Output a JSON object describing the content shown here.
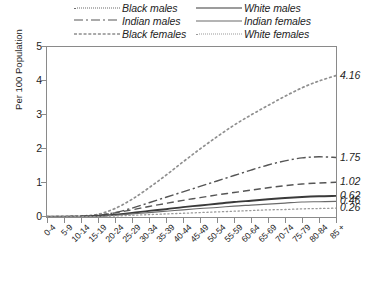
{
  "legend": {
    "entries": [
      {
        "label": "Black males",
        "style": "dotted-coarse",
        "column": "left",
        "row": 0
      },
      {
        "label": "Indian males",
        "style": "dash-dot",
        "column": "left",
        "row": 1
      },
      {
        "label": "Black females",
        "style": "dashed",
        "column": "left",
        "row": 2
      },
      {
        "label": "White males",
        "style": "solid-thick",
        "column": "right",
        "row": 0
      },
      {
        "label": "Indian females",
        "style": "solid-thin",
        "column": "right",
        "row": 1
      },
      {
        "label": "White females",
        "style": "dotted-fine",
        "column": "right",
        "row": 2
      }
    ]
  },
  "axes": {
    "ylabel": "Per 100 Population",
    "yticks": [
      "0",
      "1",
      "2",
      "3",
      "4",
      "5"
    ],
    "xticklabels": [
      "0-4",
      "5-9",
      "10-14",
      "15-19",
      "20-24",
      "25-29",
      "30-34",
      "35-39",
      "40-44",
      "45-49",
      "50-54",
      "55-59",
      "60-64",
      "65-69",
      "70-74",
      "75-79",
      "80-84",
      "85 +"
    ]
  },
  "endpoint_labels": [
    "4.16",
    "1.75",
    "1.02",
    "0.62",
    "0.46",
    "0.26"
  ],
  "colors": {
    "frame": "#8a8a8a",
    "black_males": "#8f8f8f",
    "indian_males": "#555555",
    "black_females": "#555555",
    "white_males": "#3a3a3a",
    "indian_females": "#6a6a6a",
    "white_females": "#9a9a9a",
    "text": "#1d1d1d"
  },
  "chart_data": {
    "type": "line",
    "title": "",
    "xlabel": "",
    "ylabel": "Per 100 Population",
    "ylim": [
      0,
      5
    ],
    "grid": false,
    "legend_position": "above-plot",
    "categories": [
      "0-4",
      "5-9",
      "10-14",
      "15-19",
      "20-24",
      "25-29",
      "30-34",
      "35-39",
      "40-44",
      "45-49",
      "50-54",
      "55-59",
      "60-64",
      "65-69",
      "70-74",
      "75-79",
      "80-84",
      "85 +"
    ],
    "series": [
      {
        "name": "Black males",
        "style": "dotted-coarse",
        "endpoint_label": "4.16",
        "values": [
          0.01,
          0.02,
          0.03,
          0.08,
          0.25,
          0.52,
          0.86,
          1.23,
          1.62,
          2.0,
          2.36,
          2.7,
          3.0,
          3.28,
          3.55,
          3.8,
          4.0,
          4.16
        ]
      },
      {
        "name": "Indian males",
        "style": "dash-dot",
        "endpoint_label": "1.75",
        "values": [
          0.01,
          0.01,
          0.02,
          0.05,
          0.13,
          0.26,
          0.42,
          0.58,
          0.74,
          0.9,
          1.06,
          1.22,
          1.38,
          1.53,
          1.65,
          1.74,
          1.77,
          1.75
        ]
      },
      {
        "name": "Black females",
        "style": "dashed",
        "endpoint_label": "1.02",
        "values": [
          0.01,
          0.01,
          0.02,
          0.05,
          0.12,
          0.21,
          0.31,
          0.4,
          0.49,
          0.57,
          0.65,
          0.72,
          0.79,
          0.86,
          0.92,
          0.97,
          1.0,
          1.02
        ]
      },
      {
        "name": "White males",
        "style": "solid-thick",
        "endpoint_label": "0.62",
        "values": [
          0.01,
          0.01,
          0.01,
          0.03,
          0.07,
          0.12,
          0.18,
          0.23,
          0.29,
          0.34,
          0.39,
          0.44,
          0.48,
          0.52,
          0.56,
          0.59,
          0.61,
          0.62
        ]
      },
      {
        "name": "Indian females",
        "style": "solid-thin",
        "endpoint_label": "0.46",
        "values": [
          0.01,
          0.01,
          0.01,
          0.02,
          0.05,
          0.09,
          0.13,
          0.17,
          0.21,
          0.25,
          0.28,
          0.32,
          0.35,
          0.38,
          0.41,
          0.44,
          0.45,
          0.46
        ]
      },
      {
        "name": "White females",
        "style": "dotted-fine",
        "endpoint_label": "0.26",
        "values": [
          0.0,
          0.0,
          0.01,
          0.01,
          0.03,
          0.05,
          0.07,
          0.09,
          0.11,
          0.13,
          0.15,
          0.17,
          0.19,
          0.21,
          0.22,
          0.24,
          0.25,
          0.26
        ]
      }
    ]
  }
}
